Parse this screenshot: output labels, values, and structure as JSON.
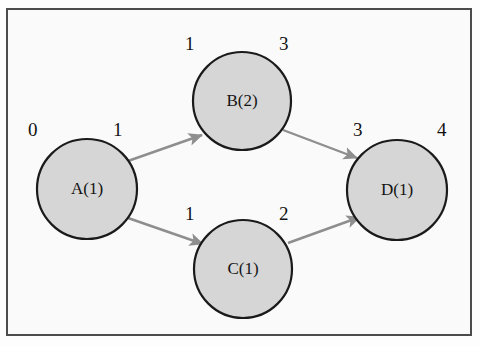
{
  "diagram": {
    "type": "directed-graph",
    "title": "",
    "frame": {
      "border_color": "#4c4c4c",
      "background": "#fafafa"
    },
    "style": {
      "node_fill": "#d6d6d6",
      "node_stroke": "#1a1a1a",
      "edge_color": "#8e8e8e"
    },
    "nodes": [
      {
        "id": "A",
        "label": "A(1)",
        "cx": 87,
        "cy": 189,
        "r": 50,
        "left_number": "0",
        "right_number": "1"
      },
      {
        "id": "B",
        "label": "B(2)",
        "cx": 242,
        "cy": 101,
        "r": 49,
        "left_number": "1",
        "right_number": "3"
      },
      {
        "id": "C",
        "label": "C(1)",
        "cx": 243,
        "cy": 269,
        "r": 49,
        "left_number": "1",
        "right_number": "2"
      },
      {
        "id": "D",
        "label": "D(1)",
        "cx": 397,
        "cy": 190,
        "r": 50,
        "left_number": "3",
        "right_number": "4"
      }
    ],
    "edges": [
      {
        "from": "A",
        "to": "B"
      },
      {
        "from": "A",
        "to": "C"
      },
      {
        "from": "B",
        "to": "D"
      },
      {
        "from": "C",
        "to": "D"
      }
    ]
  }
}
